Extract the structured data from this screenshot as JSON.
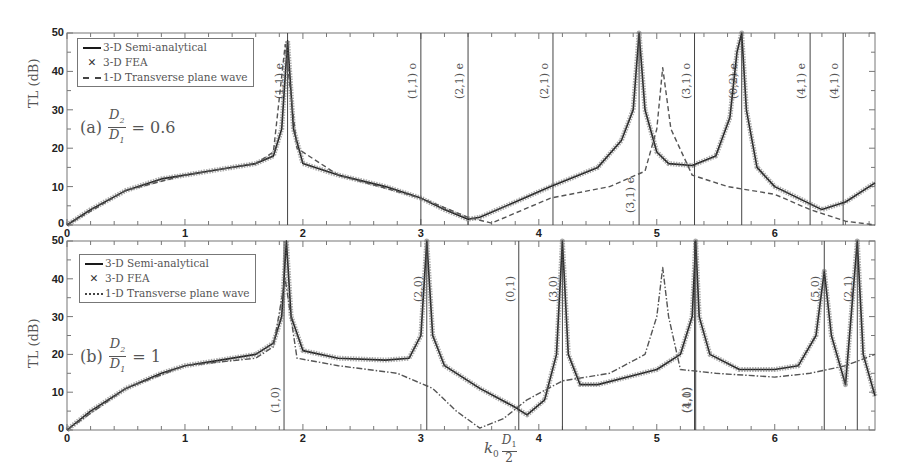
{
  "chart_data": [
    {
      "type": "line",
      "panel": "(a)",
      "title": "(a) D2/D1 = 0.6",
      "ratio_label": "= 0.6",
      "xlabel": "k0 D1/2",
      "ylabel": "TL (dB)",
      "xlim": [
        0,
        6.85
      ],
      "ylim": [
        0,
        50
      ],
      "xticks": [
        "0",
        "1",
        "2",
        "3",
        "4",
        "5",
        "6"
      ],
      "yticks": [
        "0",
        "10",
        "20",
        "30",
        "40",
        "50"
      ],
      "legend": [
        "3-D Semi-analytical",
        "3-D FEA",
        "1-D Transverse plane wave"
      ],
      "legend_position": "upper left",
      "mode_lines": [
        {
          "x": 1.87,
          "label": "(1,1) e",
          "pos": "top"
        },
        {
          "x": 3.0,
          "label": "(1,1) o",
          "pos": "top"
        },
        {
          "x": 3.4,
          "label": "(2,1) e",
          "pos": "top"
        },
        {
          "x": 4.12,
          "label": "(2,1) o",
          "pos": "top"
        },
        {
          "x": 4.85,
          "label": "(3,1) e",
          "pos": "bottom"
        },
        {
          "x": 5.32,
          "label": "(3,1) o",
          "pos": "top"
        },
        {
          "x": 5.72,
          "label": "(0,2) e",
          "pos": "top"
        },
        {
          "x": 6.3,
          "label": "(4,1) e",
          "pos": "top"
        },
        {
          "x": 6.58,
          "label": "(4,1) o",
          "pos": "top"
        }
      ],
      "series": [
        {
          "name": "3-D Semi-analytical",
          "x": [
            0,
            0.2,
            0.5,
            0.8,
            1.0,
            1.3,
            1.6,
            1.75,
            1.82,
            1.87,
            1.92,
            2.0,
            2.3,
            2.7,
            3.0,
            3.2,
            3.4,
            3.5,
            3.8,
            4.1,
            4.5,
            4.7,
            4.8,
            4.85,
            4.9,
            5.0,
            5.1,
            5.3,
            5.5,
            5.62,
            5.68,
            5.72,
            5.76,
            5.85,
            6.0,
            6.2,
            6.4,
            6.6,
            6.85
          ],
          "y": [
            0,
            4,
            9,
            12,
            13,
            14.5,
            16,
            18,
            25,
            48,
            25,
            16,
            13,
            10,
            7,
            4,
            1.5,
            2,
            6,
            10,
            15,
            22,
            30,
            50,
            30,
            19,
            16,
            15.5,
            18,
            28,
            45,
            50,
            30,
            15,
            10,
            7,
            4,
            6,
            11
          ]
        },
        {
          "name": "3-D FEA",
          "x": [
            0,
            0.5,
            1.0,
            1.6,
            1.87,
            2.3,
            3.0,
            3.4,
            4.1,
            4.85,
            5.3,
            5.72,
            6.4,
            6.85
          ],
          "y": [
            0,
            9,
            13,
            16,
            48,
            13,
            7,
            1.5,
            10,
            50,
            15.5,
            50,
            4,
            11
          ]
        },
        {
          "name": "1-D Transverse plane wave",
          "x": [
            0,
            0.5,
            1.0,
            1.6,
            1.75,
            1.85,
            1.95,
            2.3,
            3.0,
            3.4,
            3.6,
            4.1,
            4.6,
            4.9,
            5.0,
            5.05,
            5.12,
            5.3,
            5.6,
            6.0,
            6.3,
            6.6,
            6.85
          ],
          "y": [
            0,
            9,
            13,
            16,
            19,
            47,
            20,
            13,
            7,
            2,
            0.5,
            7,
            10,
            14,
            25,
            41,
            25,
            13,
            10,
            8,
            4,
            1,
            0
          ]
        }
      ]
    },
    {
      "type": "line",
      "panel": "(b)",
      "title": "(b) D2/D1 = 1",
      "ratio_label": "= 1",
      "xlabel": "k0 D1/2",
      "ylabel": "TL (dB)",
      "xlim": [
        0,
        6.85
      ],
      "ylim": [
        0,
        50
      ],
      "xticks": [
        "0",
        "1",
        "2",
        "3",
        "4",
        "5",
        "6"
      ],
      "yticks": [
        "0",
        "10",
        "20",
        "30",
        "40",
        "50"
      ],
      "legend": [
        "3-D Semi-analytical",
        "3-D FEA",
        "1-D Transverse plane wave"
      ],
      "legend_position": "upper left",
      "mode_lines": [
        {
          "x": 1.84,
          "label": "(1,0)",
          "pos": "bottom"
        },
        {
          "x": 3.05,
          "label": "(2,0)",
          "pos": "top"
        },
        {
          "x": 3.83,
          "label": "(0,1)",
          "pos": "top"
        },
        {
          "x": 4.2,
          "label": "(3,0)",
          "pos": "top"
        },
        {
          "x": 5.32,
          "label": "(1,1)",
          "pos": "bottom"
        },
        {
          "x": 5.33,
          "label": "(4,0)",
          "pos": "bottom"
        },
        {
          "x": 6.42,
          "label": "(5,0)",
          "pos": "top"
        },
        {
          "x": 6.7,
          "label": "(2,1)",
          "pos": "top"
        }
      ],
      "series": [
        {
          "name": "3-D Semi-analytical",
          "x": [
            0,
            0.2,
            0.5,
            0.8,
            1.0,
            1.3,
            1.6,
            1.75,
            1.82,
            1.86,
            1.9,
            2.0,
            2.3,
            2.7,
            2.9,
            3.0,
            3.05,
            3.1,
            3.2,
            3.5,
            3.8,
            3.9,
            4.05,
            4.15,
            4.2,
            4.25,
            4.35,
            4.5,
            5.0,
            5.2,
            5.3,
            5.33,
            5.36,
            5.45,
            5.7,
            6.0,
            6.2,
            6.35,
            6.42,
            6.48,
            6.6,
            6.7,
            6.75,
            6.85
          ],
          "y": [
            0,
            5,
            11,
            15,
            17,
            18.5,
            20,
            23,
            30,
            50,
            30,
            21,
            19,
            18.5,
            19,
            25,
            50,
            25,
            17,
            11,
            6,
            4,
            8,
            20,
            50,
            20,
            12,
            12,
            16,
            20,
            30,
            50,
            30,
            20,
            16,
            16,
            17,
            25,
            42,
            25,
            12,
            50,
            20,
            9
          ]
        },
        {
          "name": "3-D FEA",
          "x": [
            0,
            0.5,
            1.0,
            1.6,
            1.86,
            2.3,
            3.05,
            3.5,
            3.9,
            4.2,
            4.35,
            5.0,
            5.33,
            5.7,
            6.2,
            6.42,
            6.6,
            6.7,
            6.85
          ],
          "y": [
            0,
            11,
            17,
            20,
            50,
            19,
            50,
            11,
            4,
            50,
            12,
            16,
            50,
            16,
            17,
            42,
            12,
            50,
            9
          ]
        },
        {
          "name": "1-D Transverse plane wave",
          "x": [
            0,
            0.5,
            1.0,
            1.6,
            1.75,
            1.85,
            1.95,
            2.3,
            2.8,
            3.1,
            3.3,
            3.5,
            3.7,
            3.9,
            4.2,
            4.6,
            4.9,
            5.0,
            5.05,
            5.1,
            5.2,
            5.5,
            6.0,
            6.3,
            6.6,
            6.85
          ],
          "y": [
            0,
            11,
            17,
            19,
            22,
            40,
            19,
            17,
            15,
            11,
            5,
            0.5,
            3,
            8,
            13,
            15,
            20,
            30,
            43,
            30,
            16,
            15,
            14,
            15,
            17,
            20
          ]
        }
      ]
    }
  ],
  "legend_labels": {
    "semi": "3-D Semi-analytical",
    "fea": "3-D FEA",
    "plane": "1-D Transverse plane wave"
  },
  "axis": {
    "ylabel": "TL (dB)",
    "xlabel_k": "k",
    "xlabel_sub": "0",
    "xlabel_num": "D",
    "xlabel_num_sub": "1",
    "xlabel_den": "2"
  },
  "panel_labels": {
    "a_prefix": "(a)",
    "a_value": "= 0.6",
    "b_prefix": "(b)",
    "b_value": "= 1",
    "frac_num": "D",
    "frac_num_sub": "2",
    "frac_den": "D",
    "frac_den_sub": "1"
  },
  "colors": {
    "semi": "#1a1a1a",
    "fea": "#666666",
    "plane": "#555555",
    "mode_line": "#444444",
    "axis": "#777777"
  }
}
